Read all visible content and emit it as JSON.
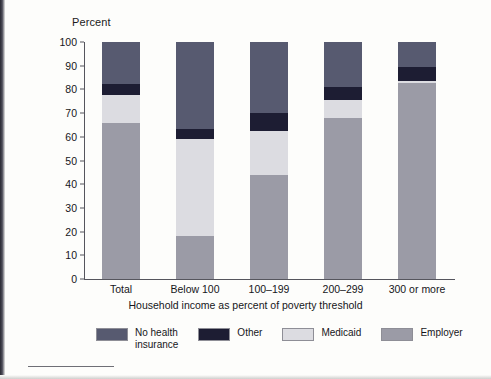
{
  "chart_data": {
    "type": "bar",
    "subtype": "stacked-vertical-100",
    "title": "",
    "ylabel": "Percent",
    "xlabel": "Household income as percent of poverty threshold",
    "ylim": [
      0,
      100
    ],
    "yticks": [
      0,
      10,
      20,
      30,
      40,
      50,
      60,
      70,
      80,
      90,
      100
    ],
    "grid": false,
    "legend_position": "bottom",
    "categories": [
      "Total",
      "Below 100",
      "100–199",
      "200–299",
      "300 or more"
    ],
    "series": [
      {
        "name": "Employer",
        "color": "#9b9ba6",
        "values": [
          66.0,
          18.0,
          44.0,
          68.0,
          82.5
        ]
      },
      {
        "name": "Medicaid",
        "color": "#dcdce1",
        "values": [
          11.5,
          41.0,
          18.5,
          7.5,
          1.0
        ]
      },
      {
        "name": "Other",
        "color": "#1d1d33",
        "values": [
          5.0,
          4.5,
          7.5,
          5.5,
          6.0
        ]
      },
      {
        "name": "No health insurance",
        "color": "#575a70",
        "values": [
          17.5,
          36.5,
          30.0,
          19.0,
          10.5
        ]
      }
    ],
    "stack_order_bottom_to_top": [
      "Employer",
      "Medicaid",
      "Other",
      "No health insurance"
    ]
  },
  "axes": {
    "y_title": "Percent",
    "x_title": "Household income as percent of poverty threshold",
    "y_tick_labels": [
      "100",
      "90",
      "80",
      "70",
      "60",
      "50",
      "40",
      "30",
      "20",
      "10",
      "0"
    ],
    "x_tick_labels": [
      "Total",
      "Below 100",
      "100–199",
      "200–299",
      "300 or more"
    ]
  },
  "legend": {
    "items": [
      {
        "label": "No health insurance",
        "color": "#575a70"
      },
      {
        "label": "Other",
        "color": "#1d1d33"
      },
      {
        "label": "Medicaid",
        "color": "#dcdce1"
      },
      {
        "label": "Employer",
        "color": "#9b9ba6"
      }
    ]
  },
  "colors": {
    "no_health_insurance": "#575a70",
    "other": "#1d1d33",
    "medicaid": "#dcdce1",
    "employer": "#9b9ba6",
    "axis": "#55555d",
    "text": "#16161a",
    "background": "#fdfdfb"
  }
}
